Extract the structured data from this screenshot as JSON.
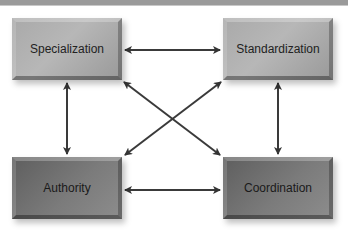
{
  "header": {
    "bar_color": "#9a9a9a"
  },
  "diagram": {
    "boxes": [
      {
        "id": "specialization",
        "label": "Specialization",
        "shade": "light"
      },
      {
        "id": "standardization",
        "label": "Standardization",
        "shade": "light"
      },
      {
        "id": "authority",
        "label": "Authority",
        "shade": "dark"
      },
      {
        "id": "coordination",
        "label": "Coordination",
        "shade": "dark"
      }
    ],
    "connections": [
      {
        "from": "Specialization",
        "to": "Standardization",
        "type": "bidirectional"
      },
      {
        "from": "Specialization",
        "to": "Authority",
        "type": "bidirectional"
      },
      {
        "from": "Standardization",
        "to": "Coordination",
        "type": "bidirectional"
      },
      {
        "from": "Authority",
        "to": "Coordination",
        "type": "bidirectional"
      },
      {
        "from": "Specialization",
        "to": "Coordination",
        "type": "bidirectional"
      },
      {
        "from": "Standardization",
        "to": "Authority",
        "type": "bidirectional"
      }
    ],
    "colors": {
      "light_box": "#aaaaaa",
      "dark_box": "#6e6e6e",
      "arrow": "#333333"
    }
  }
}
